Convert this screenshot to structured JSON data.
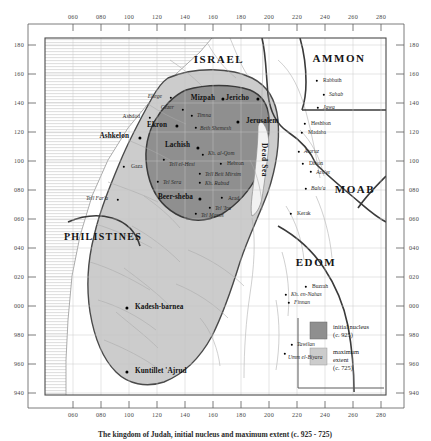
{
  "figure": {
    "caption": "The kingdom of Judah, initial nucleus and maximum extent (c. 925 - 725)",
    "type": "historical-map"
  },
  "axes": {
    "top_ticks": [
      "060",
      "080",
      "100",
      "120",
      "140",
      "160",
      "180",
      "200",
      "220",
      "240",
      "260",
      "280"
    ],
    "bottom_ticks": [
      "060",
      "080",
      "100",
      "120",
      "140",
      "160",
      "180",
      "200",
      "220",
      "240",
      "260",
      "280"
    ],
    "left_ticks": [
      "180",
      "160",
      "140",
      "120",
      "100",
      "080",
      "060",
      "040",
      "020",
      "000",
      "980",
      "960",
      "940"
    ],
    "right_ticks": [
      "180",
      "160",
      "140",
      "120",
      "100",
      "080",
      "060",
      "040",
      "020",
      "000",
      "980",
      "960",
      "940"
    ]
  },
  "legend": {
    "items": [
      {
        "swatch": "#8f8f8f",
        "label": "initial nucleus\n(c. 925)"
      },
      {
        "swatch": "#cccccc",
        "label": "maximum\nextent\n(c. 725)"
      }
    ]
  },
  "colors": {
    "initial_nucleus": "#8f8f8f",
    "maximum_extent": "#cccccc",
    "sea": "#efefef",
    "border": "#3a3a3a",
    "grid": "#bfbfbf",
    "hatch": "#d8d8d8"
  },
  "regions": [
    {
      "name": "ISRAEL",
      "x": 219,
      "y": 59,
      "size": "lg"
    },
    {
      "name": "AMMON",
      "x": 339,
      "y": 58,
      "size": "lg"
    },
    {
      "name": "MOAB",
      "x": 355,
      "y": 189,
      "size": "lg"
    },
    {
      "name": "EDOM",
      "x": 316,
      "y": 262,
      "size": "lg"
    },
    {
      "name": "PHILISTINES",
      "x": 103,
      "y": 237,
      "size": "sm"
    }
  ],
  "water": [
    {
      "name": "Dead Sea",
      "x": 264,
      "y": 160
    }
  ],
  "sites": [
    {
      "name": "Eltege",
      "x": 162,
      "y": 97,
      "anchor": "right",
      "cls": "site-minor ital",
      "dx": -5,
      "dot_x": 171,
      "dot_y": 98
    },
    {
      "name": "Gezer",
      "x": 174,
      "y": 108,
      "anchor": "right",
      "cls": "site-minor ital",
      "dx": -5,
      "dot_x": 183,
      "dot_y": 110
    },
    {
      "name": "Ashdod",
      "x": 140,
      "y": 117,
      "anchor": "right",
      "cls": "site-minor",
      "dx": -5,
      "dot_x": 150,
      "dot_y": 118
    },
    {
      "name": "Ekron",
      "x": 167,
      "y": 126,
      "anchor": "right",
      "cls": "site-major",
      "dx": -5,
      "dot_x": 177,
      "dot_y": 126
    },
    {
      "name": "Ashkelon",
      "x": 129,
      "y": 137,
      "anchor": "right",
      "cls": "site-major",
      "dx": -5,
      "dot_x": 140,
      "dot_y": 138
    },
    {
      "name": "Gaza",
      "x": 131,
      "y": 167,
      "anchor": "left",
      "cls": "site-minor",
      "dx": 5,
      "dot_x": 124,
      "dot_y": 167
    },
    {
      "name": "Tell Far'a",
      "x": 108,
      "y": 199,
      "anchor": "right",
      "cls": "site-minor ital",
      "dx": -5,
      "dot_x": 118,
      "dot_y": 200
    },
    {
      "name": "Mizpah",
      "x": 215,
      "y": 99,
      "anchor": "right",
      "cls": "site-major",
      "dx": -5,
      "dot_x": 223,
      "dot_y": 99
    },
    {
      "name": "Jericho",
      "x": 249,
      "y": 99,
      "anchor": "right",
      "cls": "site-major",
      "dx": -5,
      "dot_x": 258,
      "dot_y": 99
    },
    {
      "name": "Timna",
      "x": 197,
      "y": 116,
      "anchor": "left",
      "cls": "site-minor ital",
      "dx": 5,
      "dot_x": 192,
      "dot_y": 116
    },
    {
      "name": "Jerusalem",
      "x": 246,
      "y": 122,
      "anchor": "left",
      "cls": "site-major",
      "dx": 5,
      "dot_x": 238,
      "dot_y": 122
    },
    {
      "name": "Beth Shemesh",
      "x": 200,
      "y": 129,
      "anchor": "left",
      "cls": "site-minor ital",
      "dx": 5,
      "dot_x": 196,
      "dot_y": 128
    },
    {
      "name": "Lachish",
      "x": 190,
      "y": 146,
      "anchor": "right",
      "cls": "site-major",
      "dx": -5,
      "dot_x": 198,
      "dot_y": 148
    },
    {
      "name": "Kh. al-Qom",
      "x": 208,
      "y": 154,
      "anchor": "left",
      "cls": "site-minor ital",
      "dx": 5,
      "dot_x": 203,
      "dot_y": 155
    },
    {
      "name": "Tell el-Hesi",
      "x": 169,
      "y": 165,
      "anchor": "left",
      "cls": "site-minor ital",
      "dx": 5,
      "dot_x": 164,
      "dot_y": 160
    },
    {
      "name": "Hebron",
      "x": 227,
      "y": 164,
      "anchor": "left",
      "cls": "site-minor",
      "dx": 5,
      "dot_x": 221,
      "dot_y": 164
    },
    {
      "name": "Tell Beit Mirsim",
      "x": 205,
      "y": 175,
      "anchor": "left",
      "cls": "site-minor ital",
      "dx": 5,
      "dot_x": 200,
      "dot_y": 174
    },
    {
      "name": "Tel Sera",
      "x": 163,
      "y": 183,
      "anchor": "left",
      "cls": "site-minor ital",
      "dx": 5,
      "dot_x": 158,
      "dot_y": 182
    },
    {
      "name": "Kh. Rabud",
      "x": 205,
      "y": 184,
      "anchor": "left",
      "cls": "site-minor ital",
      "dx": 5,
      "dot_x": 200,
      "dot_y": 183
    },
    {
      "name": "Beer-sheba",
      "x": 193,
      "y": 198,
      "anchor": "right",
      "cls": "site-major",
      "dx": -5,
      "dot_x": 200,
      "dot_y": 199
    },
    {
      "name": "Arad",
      "x": 228,
      "y": 199,
      "anchor": "left",
      "cls": "site-minor",
      "dx": 5,
      "dot_x": 222,
      "dot_y": 198
    },
    {
      "name": "Tel 'Ira",
      "x": 215,
      "y": 209,
      "anchor": "left",
      "cls": "site-minor ital",
      "dx": 5,
      "dot_x": 210,
      "dot_y": 208
    },
    {
      "name": "Tel Masos",
      "x": 201,
      "y": 216,
      "anchor": "left",
      "cls": "site-minor ital",
      "dx": 5,
      "dot_x": 196,
      "dot_y": 214
    },
    {
      "name": "Kadesh-barnea",
      "x": 135,
      "y": 308,
      "anchor": "left",
      "cls": "site-major",
      "dx": 5,
      "dot_x": 127,
      "dot_y": 308
    },
    {
      "name": "Kuntillet 'Ajrud",
      "x": 135,
      "y": 372,
      "anchor": "left",
      "cls": "site-major",
      "dx": 5,
      "dot_x": 127,
      "dot_y": 372
    },
    {
      "name": "Rabbath",
      "x": 323,
      "y": 81,
      "anchor": "left",
      "cls": "site-minor",
      "dx": 5,
      "dot_x": 317,
      "dot_y": 81
    },
    {
      "name": "Sahab",
      "x": 329,
      "y": 95,
      "anchor": "left",
      "cls": "site-minor ital",
      "dx": 5,
      "dot_x": 324,
      "dot_y": 95
    },
    {
      "name": "Jawa",
      "x": 323,
      "y": 108,
      "anchor": "left",
      "cls": "site-minor ital",
      "dx": 5,
      "dot_x": 318,
      "dot_y": 108
    },
    {
      "name": "Heshbon",
      "x": 311,
      "y": 124,
      "anchor": "left",
      "cls": "site-minor",
      "dx": 5,
      "dot_x": 305,
      "dot_y": 124
    },
    {
      "name": "Madaba",
      "x": 308,
      "y": 133,
      "anchor": "left",
      "cls": "site-minor",
      "dx": 5,
      "dot_x": 302,
      "dot_y": 133
    },
    {
      "name": "Ataruz",
      "x": 304,
      "y": 152,
      "anchor": "left",
      "cls": "site-minor ital",
      "dx": 5,
      "dot_x": 299,
      "dot_y": 152
    },
    {
      "name": "Dibon",
      "x": 309,
      "y": 164,
      "anchor": "left",
      "cls": "site-minor",
      "dx": 5,
      "dot_x": 303,
      "dot_y": 164
    },
    {
      "name": "Aro'er",
      "x": 316,
      "y": 173,
      "anchor": "left",
      "cls": "site-minor",
      "dx": 5,
      "dot_x": 311,
      "dot_y": 172
    },
    {
      "name": "Balu'a",
      "x": 311,
      "y": 189,
      "anchor": "left",
      "cls": "site-minor ital",
      "dx": 5,
      "dot_x": 306,
      "dot_y": 189
    },
    {
      "name": "Kerak",
      "x": 297,
      "y": 214,
      "anchor": "left",
      "cls": "site-minor",
      "dx": 5,
      "dot_x": 291,
      "dot_y": 214
    },
    {
      "name": "Buzrah",
      "x": 312,
      "y": 287,
      "anchor": "left",
      "cls": "site-minor",
      "dx": 5,
      "dot_x": 306,
      "dot_y": 287
    },
    {
      "name": "Kh. en-Nahas",
      "x": 291,
      "y": 295,
      "anchor": "left",
      "cls": "site-minor ital",
      "dx": 5,
      "dot_x": 286,
      "dot_y": 295
    },
    {
      "name": "Finnan",
      "x": 294,
      "y": 303,
      "anchor": "left",
      "cls": "site-minor ital",
      "dx": 5,
      "dot_x": 289,
      "dot_y": 303
    },
    {
      "name": "Tawilan",
      "x": 297,
      "y": 345,
      "anchor": "left",
      "cls": "site-minor ital",
      "dx": 5,
      "dot_x": 292,
      "dot_y": 345
    },
    {
      "name": "Umm el-Biyara",
      "x": 288,
      "y": 358,
      "anchor": "left",
      "cls": "site-minor ital",
      "dx": 5,
      "dot_x": 285,
      "dot_y": 354
    }
  ]
}
